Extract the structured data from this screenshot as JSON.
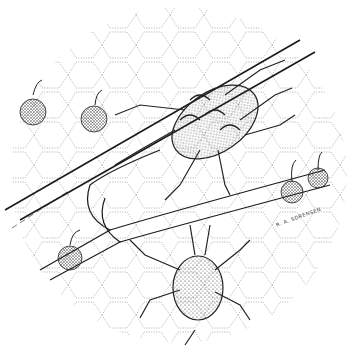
{
  "illustration": {
    "subject": "stippled pen-and-ink drawing of two mites on a leaf surface with cells, veins and spherical spores",
    "signature": "R. A. SORENSEN",
    "colors": {
      "ink": "#1a1a1a",
      "background": "#ffffff",
      "stipple": "#555555"
    }
  }
}
